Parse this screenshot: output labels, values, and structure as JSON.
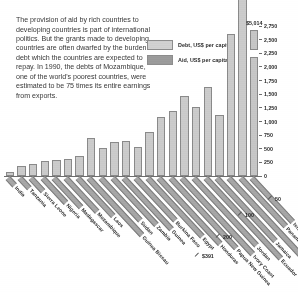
{
  "figure": {
    "intro_text": "The provision of aid by rich countries to developing countries is part of international politics. But the grants made to developing countries are often dwarfed by the burden of debt which the countries are expected to repay. In 1990, the debts of Mozambique, one of the world's poorest countries, were estimated to be 75 times its entire earnings from exports."
  },
  "legend": {
    "position": "top-right",
    "items": [
      {
        "label": "Debt, US$ per capita",
        "color": "#cfcfcf",
        "swatch_name": "legend-swatch-debt"
      },
      {
        "label": "Aid, US$ per capita",
        "color": "#9b9b9b",
        "swatch_name": "legend-swatch-aid"
      }
    ]
  },
  "chart_data": {
    "type": "bar",
    "title": "",
    "xlabel": "",
    "ylabel": "US$ per capita",
    "ylim": [
      0,
      2750
    ],
    "grid": false,
    "y_ticks": [
      "0",
      "250",
      "500",
      "750",
      "1,000",
      "1,250",
      "1,500",
      "1,750",
      "2,000",
      "2,250",
      "2,500",
      "2,750"
    ],
    "y_tick_values": [
      0,
      250,
      500,
      750,
      1000,
      1250,
      1500,
      1750,
      2000,
      2250,
      2500,
      2750
    ],
    "categories": [
      "India",
      "Tanzania",
      "Sierra Leone",
      "Nigeria",
      "Madagascar",
      "Mozambique",
      "Laos",
      "Guinea Bissau",
      "Sudan",
      "Zambia",
      "Guinea",
      "Burkina Faso",
      "Egypt",
      "Honduras",
      "Papua New Guinea",
      "Ivory Coast",
      "Jordan",
      "Ecuador",
      "Jamaica",
      "Congo",
      "Panama",
      "Israel"
    ],
    "series": [
      {
        "name": "Debt, US$ per capita",
        "color": "#cfcfcf",
        "values": [
          70,
          190,
          230,
          270,
          300,
          310,
          360,
          690,
          510,
          620,
          650,
          530,
          800,
          1080,
          1200,
          1460,
          1270,
          1640,
          1120,
          2600,
          5014,
          5014
        ]
      }
    ],
    "bar_value_labels": [
      {
        "category": "Israel",
        "label": "$5,014",
        "broken_axis": true
      }
    ],
    "annotations": [
      {
        "text": "$391",
        "refers_to": "aid"
      },
      {
        "text": "200",
        "refers_to": "aid"
      },
      {
        "text": "100",
        "refers_to": "aid"
      },
      {
        "text": "50",
        "refers_to": "aid"
      }
    ]
  }
}
